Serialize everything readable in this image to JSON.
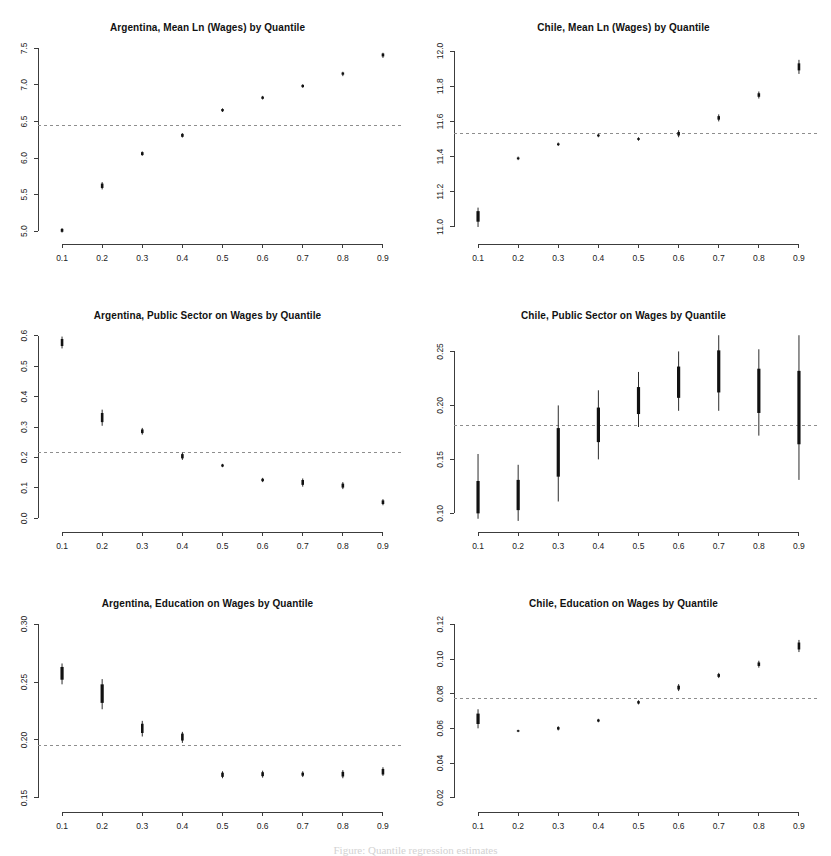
{
  "figure": {
    "width": 831,
    "height": 856,
    "background": "#ffffff",
    "marker_color": "#111111",
    "reference_line_color": "#8e8e8e",
    "axis_color": "#3c3c3c",
    "caption_partial": "Figure: Quantile regression estimates"
  },
  "chart_data": [
    {
      "type": "scatter",
      "id": "argentina-mean-wages",
      "title": "Argentina, Mean Ln (Wages) by Quantile",
      "xlabel": "",
      "ylabel": "",
      "grid": false,
      "legend": "none",
      "x": [
        0.1,
        0.2,
        0.3,
        0.4,
        0.5,
        0.6,
        0.7,
        0.8,
        0.9
      ],
      "xticks": [
        "0.1",
        "0.2",
        "0.3",
        "0.4",
        "0.5",
        "0.6",
        "0.7",
        "0.8",
        "0.9"
      ],
      "yticks": [
        "5.0",
        "5.5",
        "6.0",
        "6.5",
        "7.0",
        "7.5"
      ],
      "ytickvals": [
        5.0,
        5.5,
        6.0,
        6.5,
        7.0,
        7.5
      ],
      "xlim": [
        0.06,
        0.94
      ],
      "ylim": [
        4.96,
        7.56
      ],
      "reference_line": 6.44,
      "values": [
        5.01,
        5.62,
        6.06,
        6.31,
        6.65,
        6.82,
        6.98,
        7.15,
        7.41
      ],
      "ci_outer_low": [
        4.98,
        5.57,
        6.03,
        6.28,
        6.63,
        6.8,
        6.96,
        7.12,
        7.37
      ],
      "ci_outer_high": [
        5.04,
        5.67,
        6.09,
        6.34,
        6.68,
        6.85,
        7.01,
        7.18,
        7.44
      ],
      "ci_inner_low": [
        4.99,
        5.59,
        6.04,
        6.29,
        6.64,
        6.81,
        6.97,
        7.14,
        7.39
      ],
      "ci_inner_high": [
        5.03,
        5.65,
        6.08,
        6.33,
        6.67,
        6.84,
        7.0,
        7.17,
        7.43
      ]
    },
    {
      "type": "scatter",
      "id": "chile-mean-wages",
      "title": "Chile, Mean Ln (Wages) by Quantile",
      "xlabel": "",
      "ylabel": "",
      "grid": false,
      "legend": "none",
      "x": [
        0.1,
        0.2,
        0.3,
        0.4,
        0.5,
        0.6,
        0.7,
        0.8,
        0.9
      ],
      "xticks": [
        "0.1",
        "0.2",
        "0.3",
        "0.4",
        "0.5",
        "0.6",
        "0.7",
        "0.8",
        "0.9"
      ],
      "yticks": [
        "11.0",
        "11.2",
        "11.4",
        "11.6",
        "11.8",
        "12.0"
      ],
      "ytickvals": [
        11.0,
        11.2,
        11.4,
        11.6,
        11.8,
        12.0
      ],
      "xlim": [
        0.06,
        0.94
      ],
      "ylim": [
        10.96,
        12.04
      ],
      "reference_line": 11.53,
      "values": [
        11.06,
        11.39,
        11.47,
        11.52,
        11.5,
        11.53,
        11.62,
        11.75,
        11.91
      ],
      "ci_outer_low": [
        11.0,
        11.38,
        11.46,
        11.51,
        11.49,
        11.51,
        11.6,
        11.73,
        11.87
      ],
      "ci_outer_high": [
        11.11,
        11.4,
        11.48,
        11.53,
        11.51,
        11.55,
        11.64,
        11.77,
        11.95
      ],
      "ci_inner_low": [
        11.03,
        11.385,
        11.465,
        11.515,
        11.495,
        11.52,
        11.61,
        11.74,
        11.89
      ],
      "ci_inner_high": [
        11.09,
        11.395,
        11.475,
        11.525,
        11.505,
        11.54,
        11.63,
        11.76,
        11.93
      ]
    },
    {
      "type": "scatter",
      "id": "argentina-public-sector",
      "title": "Argentina, Public Sector on Wages by Quantile",
      "xlabel": "",
      "ylabel": "",
      "grid": false,
      "legend": "none",
      "x": [
        0.1,
        0.2,
        0.3,
        0.4,
        0.5,
        0.6,
        0.7,
        0.8,
        0.9
      ],
      "xticks": [
        "0.1",
        "0.2",
        "0.3",
        "0.4",
        "0.5",
        "0.6",
        "0.7",
        "0.8",
        "0.9"
      ],
      "yticks": [
        "0.0",
        "0.1",
        "0.2",
        "0.3",
        "0.4",
        "0.5",
        "0.6"
      ],
      "ytickvals": [
        0.0,
        0.1,
        0.2,
        0.3,
        0.4,
        0.5,
        0.6
      ],
      "xlim": [
        0.06,
        0.94
      ],
      "ylim": [
        -0.012,
        0.612
      ],
      "reference_line": 0.216,
      "values": [
        0.577,
        0.331,
        0.286,
        0.204,
        0.173,
        0.126,
        0.118,
        0.107,
        0.053
      ],
      "ci_outer_low": [
        0.558,
        0.304,
        0.275,
        0.192,
        0.168,
        0.119,
        0.104,
        0.096,
        0.043
      ],
      "ci_outer_high": [
        0.597,
        0.357,
        0.297,
        0.216,
        0.179,
        0.133,
        0.131,
        0.119,
        0.063
      ],
      "ci_inner_low": [
        0.566,
        0.316,
        0.28,
        0.197,
        0.17,
        0.122,
        0.11,
        0.101,
        0.047
      ],
      "ci_inner_high": [
        0.589,
        0.346,
        0.292,
        0.211,
        0.177,
        0.13,
        0.126,
        0.114,
        0.059
      ]
    },
    {
      "type": "scatter",
      "id": "chile-public-sector",
      "title": "Chile, Public Sector on Wages by Quantile",
      "xlabel": "",
      "ylabel": "",
      "grid": false,
      "legend": "none",
      "x": [
        0.1,
        0.2,
        0.3,
        0.4,
        0.5,
        0.6,
        0.7,
        0.8,
        0.9
      ],
      "xticks": [
        "0.1",
        "0.2",
        "0.3",
        "0.4",
        "0.5",
        "0.6",
        "0.7",
        "0.8",
        "0.9"
      ],
      "yticks": [
        "0.10",
        "0.15",
        "0.20",
        "0.25"
      ],
      "ytickvals": [
        0.1,
        0.15,
        0.2,
        0.25
      ],
      "xlim": [
        0.06,
        0.94
      ],
      "ylim": [
        0.092,
        0.268
      ],
      "reference_line": 0.181,
      "values": [
        0.124,
        0.117,
        0.157,
        0.182,
        0.205,
        0.222,
        0.232,
        0.214,
        0.2
      ],
      "ci_outer_low": [
        0.095,
        0.093,
        0.111,
        0.15,
        0.18,
        0.195,
        0.195,
        0.172,
        0.131
      ],
      "ci_outer_high": [
        0.155,
        0.145,
        0.2,
        0.214,
        0.231,
        0.25,
        0.265,
        0.252,
        0.265
      ],
      "ci_inner_low": [
        0.1,
        0.103,
        0.134,
        0.166,
        0.192,
        0.207,
        0.212,
        0.193,
        0.164
      ],
      "ci_inner_high": [
        0.13,
        0.131,
        0.179,
        0.198,
        0.217,
        0.236,
        0.251,
        0.234,
        0.232
      ]
    },
    {
      "type": "scatter",
      "id": "argentina-education",
      "title": "Argentina, Education on Wages by Quantile",
      "xlabel": "",
      "ylabel": "",
      "grid": false,
      "legend": "none",
      "x": [
        0.1,
        0.2,
        0.3,
        0.4,
        0.5,
        0.6,
        0.7,
        0.8,
        0.9
      ],
      "xticks": [
        "0.1",
        "0.2",
        "0.3",
        "0.4",
        "0.5",
        "0.6",
        "0.7",
        "0.8",
        "0.9"
      ],
      "yticks": [
        "0.15",
        "0.20",
        "0.25",
        "0.30"
      ],
      "ytickvals": [
        0.15,
        0.2,
        0.25,
        0.3
      ],
      "xlim": [
        0.06,
        0.94
      ],
      "ylim": [
        0.1465,
        0.3035
      ],
      "reference_line": 0.1955,
      "values": [
        0.2575,
        0.2405,
        0.2105,
        0.2025,
        0.17,
        0.1705,
        0.1705,
        0.1705,
        0.1725
      ],
      "ci_outer_low": [
        0.248,
        0.2265,
        0.203,
        0.1975,
        0.167,
        0.1675,
        0.168,
        0.167,
        0.169
      ],
      "ci_outer_high": [
        0.266,
        0.2525,
        0.2165,
        0.207,
        0.173,
        0.1735,
        0.173,
        0.174,
        0.1765
      ],
      "ci_inner_low": [
        0.252,
        0.232,
        0.206,
        0.1995,
        0.1682,
        0.1688,
        0.1692,
        0.1685,
        0.1702
      ],
      "ci_inner_high": [
        0.263,
        0.248,
        0.214,
        0.2055,
        0.1718,
        0.1722,
        0.1718,
        0.1725,
        0.175
      ]
    },
    {
      "type": "scatter",
      "id": "chile-education",
      "title": "Chile, Education on Wages by Quantile",
      "xlabel": "",
      "ylabel": "",
      "grid": false,
      "legend": "none",
      "x": [
        0.1,
        0.2,
        0.3,
        0.4,
        0.5,
        0.6,
        0.7,
        0.8,
        0.9
      ],
      "xticks": [
        "0.1",
        "0.2",
        "0.3",
        "0.4",
        "0.5",
        "0.6",
        "0.7",
        "0.8",
        "0.9"
      ],
      "yticks": [
        "0.02",
        "0.04",
        "0.06",
        "0.08",
        "0.10",
        "0.12"
      ],
      "ytickvals": [
        0.02,
        0.04,
        0.06,
        0.08,
        0.1,
        0.12
      ],
      "xlim": [
        0.06,
        0.94
      ],
      "ylim": [
        0.0175,
        0.1225
      ],
      "reference_line": 0.0775,
      "values": [
        0.0655,
        0.0585,
        0.06,
        0.0645,
        0.075,
        0.0835,
        0.0905,
        0.097,
        0.1075
      ],
      "ci_outer_low": [
        0.06,
        0.0578,
        0.0588,
        0.0635,
        0.0738,
        0.0815,
        0.089,
        0.095,
        0.104
      ],
      "ci_outer_high": [
        0.071,
        0.0592,
        0.0612,
        0.0655,
        0.0762,
        0.0855,
        0.092,
        0.099,
        0.111
      ],
      "ci_inner_low": [
        0.0625,
        0.0581,
        0.0593,
        0.0639,
        0.0743,
        0.0824,
        0.0897,
        0.096,
        0.1055
      ],
      "ci_inner_high": [
        0.0685,
        0.0589,
        0.0607,
        0.0651,
        0.0757,
        0.0846,
        0.0913,
        0.098,
        0.1095
      ]
    }
  ]
}
